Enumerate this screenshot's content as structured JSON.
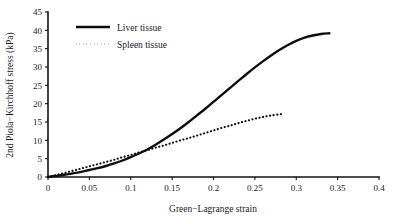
{
  "chart_data": {
    "type": "line",
    "title": "",
    "xlabel": "Green−Lagrange strain",
    "ylabel": "2nd Piola−Kirchhoff stress (kPa)",
    "xlim": [
      0,
      0.4
    ],
    "ylim": [
      0,
      45
    ],
    "xticks": [
      0,
      0.05,
      0.1,
      0.15,
      0.2,
      0.25,
      0.3,
      0.35,
      0.4
    ],
    "xtick_labels": [
      "0",
      "0.05",
      "0.1",
      "0.15",
      "0.2",
      "0.25",
      "0.3",
      "0.35",
      "0.4"
    ],
    "yticks": [
      0,
      5,
      10,
      15,
      20,
      25,
      30,
      35,
      40,
      45
    ],
    "ytick_labels": [
      "0",
      "5",
      "10",
      "15",
      "20",
      "25",
      "30",
      "35",
      "40",
      "45"
    ],
    "grid": false,
    "legend_position": "upper left",
    "series": [
      {
        "name": "Liver tissue",
        "style": "solid",
        "color": "#0d0d0d",
        "x": [
          0,
          0.01,
          0.02,
          0.03,
          0.04,
          0.05,
          0.06,
          0.07,
          0.08,
          0.09,
          0.1,
          0.11,
          0.12,
          0.13,
          0.14,
          0.15,
          0.16,
          0.17,
          0.18,
          0.19,
          0.2,
          0.21,
          0.22,
          0.23,
          0.24,
          0.25,
          0.26,
          0.27,
          0.28,
          0.29,
          0.3,
          0.31,
          0.32,
          0.33,
          0.34
        ],
        "y": [
          0,
          0.3,
          0.6,
          1.0,
          1.4,
          1.9,
          2.4,
          3.0,
          3.7,
          4.5,
          5.4,
          6.4,
          7.5,
          8.8,
          10.2,
          11.7,
          13.3,
          15.0,
          16.8,
          18.6,
          20.5,
          22.4,
          24.3,
          26.2,
          28.1,
          29.9,
          31.6,
          33.2,
          34.7,
          36.0,
          37.1,
          38.0,
          38.6,
          39.0,
          39.2
        ]
      },
      {
        "name": "Spleen tissue",
        "style": "dotted",
        "color": "#0d0d0d",
        "x": [
          0,
          0.01,
          0.02,
          0.03,
          0.04,
          0.05,
          0.06,
          0.07,
          0.08,
          0.09,
          0.1,
          0.11,
          0.12,
          0.13,
          0.14,
          0.15,
          0.16,
          0.17,
          0.18,
          0.19,
          0.2,
          0.21,
          0.22,
          0.23,
          0.24,
          0.25,
          0.26,
          0.27,
          0.28,
          0.285
        ],
        "y": [
          0,
          0.55,
          1.1,
          1.7,
          2.3,
          2.9,
          3.5,
          4.1,
          4.7,
          5.4,
          6.0,
          6.7,
          7.3,
          8.0,
          8.6,
          9.3,
          10.0,
          10.6,
          11.3,
          12.0,
          12.7,
          13.4,
          14.0,
          14.7,
          15.3,
          15.9,
          16.4,
          16.8,
          17.1,
          17.2
        ]
      }
    ],
    "legend": [
      {
        "label": "Liver tissue",
        "style": "solid"
      },
      {
        "label": "Spleen tissue",
        "style": "dotted"
      }
    ]
  }
}
